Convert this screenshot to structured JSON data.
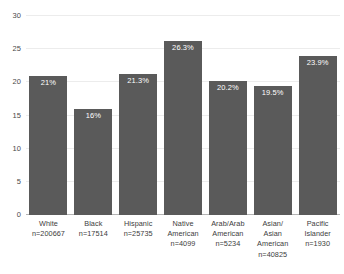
{
  "chart_data": {
    "type": "bar",
    "title": "",
    "xlabel": "",
    "ylabel": "",
    "ylim": [
      0,
      30
    ],
    "grid": true,
    "legend": "none",
    "yticks": [
      0,
      5,
      10,
      15,
      20,
      25,
      30
    ],
    "ytick_labels": [
      "0",
      "5",
      "10",
      "15",
      "20",
      "25",
      "30"
    ],
    "bar_color": "#5a5a5a",
    "value_label_color": "#ffffff",
    "background_color": "#ffffff",
    "categories": [
      "White",
      "Black",
      "Hispanic",
      "Native American",
      "Arab/Arab American",
      "Asian/Asian American",
      "Pacific Islander"
    ],
    "values": [
      21,
      16,
      21.3,
      26.3,
      20.2,
      19.5,
      23.9
    ],
    "value_labels": [
      "21%",
      "16%",
      "21.3%",
      "26.3%",
      "20.2%",
      "19.5%",
      "23.9%"
    ],
    "sample_sizes": [
      "n=200667",
      "n=17514",
      "n=25735",
      "n=4099",
      "n=5234",
      "n=40825",
      "n=1930"
    ],
    "bars": [
      {
        "category": "White",
        "value": 21,
        "value_label": "21%",
        "sample_size": "n=200667",
        "name_line1": "White",
        "name_line2": "",
        "name_line3": ""
      },
      {
        "category": "Black",
        "value": 16,
        "value_label": "16%",
        "sample_size": "n=17514",
        "name_line1": "Black",
        "name_line2": "",
        "name_line3": ""
      },
      {
        "category": "Hispanic",
        "value": 21.3,
        "value_label": "21.3%",
        "sample_size": "n=25735",
        "name_line1": "Hispanic",
        "name_line2": "",
        "name_line3": ""
      },
      {
        "category": "Native American",
        "value": 26.3,
        "value_label": "26.3%",
        "sample_size": "n=4099",
        "name_line1": "Native",
        "name_line2": "American",
        "name_line3": ""
      },
      {
        "category": "Arab/Arab American",
        "value": 20.2,
        "value_label": "20.2%",
        "sample_size": "n=5234",
        "name_line1": "Arab/Arab",
        "name_line2": "American",
        "name_line3": ""
      },
      {
        "category": "Asian/Asian American",
        "value": 19.5,
        "value_label": "19.5%",
        "sample_size": "n=40825",
        "name_line1": "Asian/",
        "name_line2": "Asian",
        "name_line3": "American"
      },
      {
        "category": "Pacific Islander",
        "value": 23.9,
        "value_label": "23.9%",
        "sample_size": "n=1930",
        "name_line1": "Pacific",
        "name_line2": "Islander",
        "name_line3": ""
      }
    ]
  }
}
